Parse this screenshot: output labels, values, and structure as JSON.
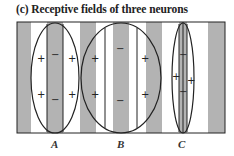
{
  "title": "(c) Receptive fields of three neurons",
  "colors": {
    "stripe_gray": "#b3b3b3",
    "stripe_white": "#ffffff",
    "line": "#222222"
  },
  "neurons": [
    {
      "label": "A",
      "center_sign": "−",
      "surround_sign": "+"
    },
    {
      "label": "B",
      "center_sign": "−",
      "surround_sign": "+"
    },
    {
      "label": "C",
      "center_sign": "−",
      "surround_sign": "+"
    }
  ],
  "signs": {
    "plus": "+",
    "minus": "−"
  }
}
